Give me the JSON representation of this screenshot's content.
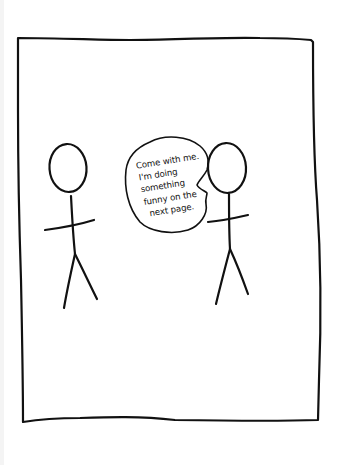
{
  "comic": {
    "panel_count": 1,
    "ink_color": "#111111",
    "background_color": "#ffffff",
    "speech_bubble": {
      "speaker": "right-figure",
      "lines": [
        "Come with me.",
        "I'm doing",
        "something",
        "funny on the",
        "next page."
      ]
    },
    "characters": [
      {
        "name": "left stick figure",
        "position": "left"
      },
      {
        "name": "right stick figure",
        "position": "right"
      }
    ]
  }
}
